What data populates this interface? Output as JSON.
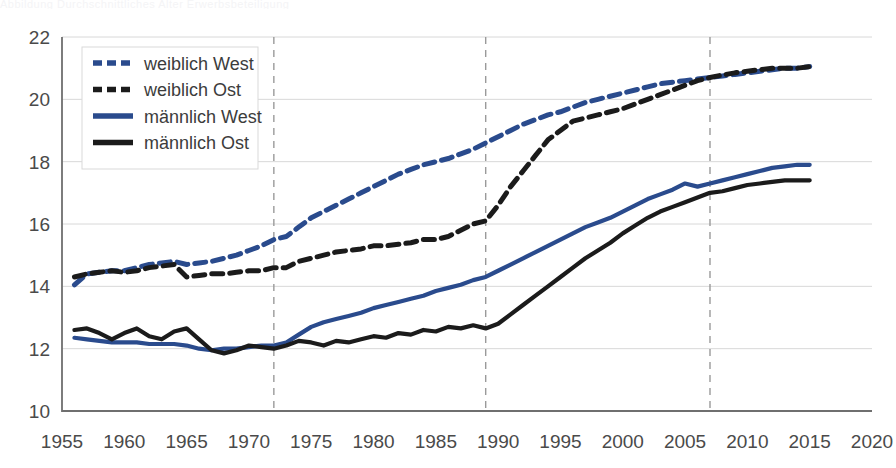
{
  "page": {
    "top_cut_text": "Abbildung  Durchschnittliches Alter  Erwerbsbeteiligung"
  },
  "chart_data": {
    "type": "line",
    "title": "",
    "subtitle": "",
    "xlabel": "",
    "ylabel": "",
    "xlim": [
      1955,
      2020
    ],
    "ylim": [
      10,
      22
    ],
    "xticks": [
      1955,
      1960,
      1965,
      1970,
      1975,
      1980,
      1985,
      1990,
      1995,
      2000,
      2005,
      2010,
      2015,
      2020
    ],
    "yticks": [
      10,
      12,
      14,
      16,
      18,
      20,
      22
    ],
    "grid": {
      "horizontal": true,
      "vertical_dashed_years": [
        1972,
        1989,
        2007
      ]
    },
    "legend": {
      "position": "top-left"
    },
    "colors": {
      "blue": "#2a4b8d",
      "black": "#1b1b1b",
      "grid": "#d8d8d8",
      "axis": "#6f6f6f"
    },
    "series": [
      {
        "name": "weiblich West",
        "color": "#2a4b8d",
        "style": "dashed",
        "x": [
          1956,
          1957,
          1958,
          1959,
          1960,
          1961,
          1962,
          1963,
          1964,
          1965,
          1966,
          1967,
          1968,
          1969,
          1970,
          1971,
          1972,
          1973,
          1974,
          1975,
          1976,
          1977,
          1978,
          1979,
          1980,
          1981,
          1982,
          1983,
          1984,
          1985,
          1986,
          1987,
          1988,
          1989,
          1990,
          1991,
          1992,
          1993,
          1994,
          1995,
          1996,
          1997,
          1998,
          1999,
          2000,
          2001,
          2002,
          2003,
          2004,
          2005,
          2006,
          2007,
          2008,
          2009,
          2010,
          2011,
          2012,
          2013,
          2014,
          2015
        ],
        "values": [
          14.05,
          14.4,
          14.45,
          14.5,
          14.5,
          14.6,
          14.7,
          14.75,
          14.8,
          14.7,
          14.75,
          14.8,
          14.9,
          15.0,
          15.15,
          15.3,
          15.5,
          15.6,
          15.9,
          16.2,
          16.4,
          16.6,
          16.8,
          17.0,
          17.2,
          17.4,
          17.6,
          17.75,
          17.9,
          18.0,
          18.1,
          18.25,
          18.4,
          18.6,
          18.8,
          19.0,
          19.2,
          19.35,
          19.5,
          19.6,
          19.75,
          19.9,
          20.0,
          20.1,
          20.2,
          20.3,
          20.4,
          20.5,
          20.55,
          20.6,
          20.65,
          20.7,
          20.75,
          20.8,
          20.85,
          20.9,
          20.95,
          21.0,
          21.0,
          21.05
        ]
      },
      {
        "name": "weiblich Ost",
        "color": "#1b1b1b",
        "style": "dashed",
        "x": [
          1956,
          1957,
          1958,
          1959,
          1960,
          1961,
          1962,
          1963,
          1964,
          1965,
          1966,
          1967,
          1968,
          1969,
          1970,
          1971,
          1972,
          1973,
          1974,
          1975,
          1976,
          1977,
          1978,
          1979,
          1980,
          1981,
          1982,
          1983,
          1984,
          1985,
          1986,
          1987,
          1988,
          1989,
          1990,
          1991,
          1992,
          1993,
          1994,
          1995,
          1996,
          1997,
          1998,
          1999,
          2000,
          2001,
          2002,
          2003,
          2004,
          2005,
          2006,
          2007,
          2008,
          2009,
          2010,
          2011,
          2012,
          2013,
          2014,
          2015
        ],
        "values": [
          14.3,
          14.4,
          14.45,
          14.5,
          14.45,
          14.5,
          14.6,
          14.65,
          14.7,
          14.3,
          14.35,
          14.4,
          14.4,
          14.45,
          14.5,
          14.5,
          14.6,
          14.6,
          14.8,
          14.9,
          15.0,
          15.1,
          15.15,
          15.2,
          15.3,
          15.3,
          15.35,
          15.4,
          15.5,
          15.5,
          15.6,
          15.8,
          16.0,
          16.1,
          16.6,
          17.2,
          17.7,
          18.2,
          18.7,
          19.0,
          19.3,
          19.4,
          19.5,
          19.6,
          19.7,
          19.85,
          20.0,
          20.15,
          20.3,
          20.45,
          20.6,
          20.7,
          20.78,
          20.85,
          20.9,
          20.95,
          21.0,
          21.0,
          21.0,
          21.05
        ]
      },
      {
        "name": "männlich West",
        "color": "#2a4b8d",
        "style": "solid",
        "x": [
          1956,
          1957,
          1958,
          1959,
          1960,
          1961,
          1962,
          1963,
          1964,
          1965,
          1966,
          1967,
          1968,
          1969,
          1970,
          1971,
          1972,
          1973,
          1974,
          1975,
          1976,
          1977,
          1978,
          1979,
          1980,
          1981,
          1982,
          1983,
          1984,
          1985,
          1986,
          1987,
          1988,
          1989,
          1990,
          1991,
          1992,
          1993,
          1994,
          1995,
          1996,
          1997,
          1998,
          1999,
          2000,
          2001,
          2002,
          2003,
          2004,
          2005,
          2006,
          2007,
          2008,
          2009,
          2010,
          2011,
          2012,
          2013,
          2014,
          2015
        ],
        "values": [
          12.35,
          12.3,
          12.25,
          12.2,
          12.2,
          12.2,
          12.15,
          12.15,
          12.15,
          12.1,
          12.0,
          11.95,
          12.0,
          12.0,
          12.05,
          12.1,
          12.1,
          12.2,
          12.45,
          12.7,
          12.85,
          12.95,
          13.05,
          13.15,
          13.3,
          13.4,
          13.5,
          13.6,
          13.7,
          13.85,
          13.95,
          14.05,
          14.2,
          14.3,
          14.5,
          14.7,
          14.9,
          15.1,
          15.3,
          15.5,
          15.7,
          15.9,
          16.05,
          16.2,
          16.4,
          16.6,
          16.8,
          16.95,
          17.1,
          17.3,
          17.2,
          17.3,
          17.4,
          17.5,
          17.6,
          17.7,
          17.8,
          17.85,
          17.9,
          17.9
        ]
      },
      {
        "name": "männlich Ost",
        "color": "#1b1b1b",
        "style": "solid",
        "x": [
          1956,
          1957,
          1958,
          1959,
          1960,
          1961,
          1962,
          1963,
          1964,
          1965,
          1966,
          1967,
          1968,
          1969,
          1970,
          1971,
          1972,
          1973,
          1974,
          1975,
          1976,
          1977,
          1978,
          1979,
          1980,
          1981,
          1982,
          1983,
          1984,
          1985,
          1986,
          1987,
          1988,
          1989,
          1990,
          1991,
          1992,
          1993,
          1994,
          1995,
          1996,
          1997,
          1998,
          1999,
          2000,
          2001,
          2002,
          2003,
          2004,
          2005,
          2006,
          2007,
          2008,
          2009,
          2010,
          2011,
          2012,
          2013,
          2014,
          2015
        ],
        "values": [
          12.6,
          12.65,
          12.5,
          12.3,
          12.5,
          12.65,
          12.4,
          12.3,
          12.55,
          12.65,
          12.3,
          11.95,
          11.85,
          11.95,
          12.1,
          12.05,
          12.0,
          12.1,
          12.25,
          12.2,
          12.1,
          12.25,
          12.2,
          12.3,
          12.4,
          12.35,
          12.5,
          12.45,
          12.6,
          12.55,
          12.7,
          12.65,
          12.75,
          12.65,
          12.8,
          13.1,
          13.4,
          13.7,
          14.0,
          14.3,
          14.6,
          14.9,
          15.15,
          15.4,
          15.7,
          15.95,
          16.2,
          16.4,
          16.55,
          16.7,
          16.85,
          17.0,
          17.05,
          17.15,
          17.25,
          17.3,
          17.35,
          17.4,
          17.4,
          17.4
        ]
      }
    ]
  }
}
